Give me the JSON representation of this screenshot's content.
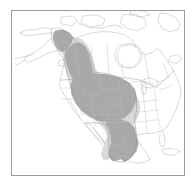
{
  "figure": {
    "kind": "range-map",
    "region": "North America",
    "title": "",
    "caption": "",
    "frame": {
      "visible": true,
      "border_color": "#9a9a9a",
      "background_color": "#ffffff"
    }
  },
  "map": {
    "projection_hint": "conic",
    "background_color": "#ffffff",
    "coastline_color": "#b9b9b9",
    "country_border_color": "#a9a9a9",
    "state_border_color": "#bcbcbc",
    "landmasses": [
      "Alaska",
      "Canada",
      "Contiguous United States",
      "Mexico",
      "Greenland",
      "Cuba",
      "Baja California",
      "Newfoundland",
      "Vancouver Island",
      "Canadian Arctic Archipelago"
    ],
    "water_features": [
      "Hudson Bay",
      "Great Lakes",
      "Gulf of Mexico",
      "Gulf of California",
      "Pacific Ocean",
      "Atlantic Ocean"
    ]
  },
  "range": {
    "legend_visible": false,
    "classes": [
      {
        "name": "core-range",
        "color": "#a9a9a9",
        "description": "Primary shaded distribution extent"
      },
      {
        "name": "peripheral-range",
        "color": "#d9d9d9",
        "description": "Lighter marginal distribution extent"
      }
    ],
    "extent_description": "Continuous band from the southeastern Alaska panhandle and coastal British Columbia south through the Rocky Mountains and interior western United States, then into the Mexican Sierra Madre Occidental and Oriental",
    "covered_areas": [
      "Southeast Alaska",
      "British Columbia",
      "Alberta",
      "Washington",
      "Oregon",
      "Idaho",
      "Montana",
      "Wyoming",
      "Utah",
      "Nevada",
      "Colorado",
      "Arizona",
      "New Mexico",
      "Western Texas",
      "Northern Mexico",
      "Sierra Madre Occidental",
      "Sierra Madre Oriental"
    ]
  }
}
